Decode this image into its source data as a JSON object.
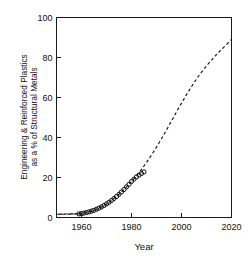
{
  "chart_data": {
    "type": "line",
    "title": "",
    "xlabel": "Year",
    "ylabel": "Engineering & Reinforced Plastics as a % of Structural Metals",
    "ylabel_line1": "Engineering & Reinforced Plastics",
    "ylabel_line2": "as a % of Structural Metals",
    "xlim": [
      1950,
      2020
    ],
    "ylim": [
      0,
      100
    ],
    "xticks": [
      1960,
      1980,
      2000,
      2020
    ],
    "xtick_labels": [
      "1960",
      "1980",
      "2000",
      "2020"
    ],
    "yticks": [
      0,
      20,
      40,
      60,
      80,
      100
    ],
    "ytick_labels": [
      "0",
      "20",
      "40",
      "60",
      "80",
      "100"
    ],
    "grid": false,
    "legend": "none",
    "series": [
      {
        "name": "Observed data",
        "marker": "open-circle",
        "x": [
          1959,
          1960,
          1961,
          1962,
          1963,
          1964,
          1965,
          1966,
          1967,
          1968,
          1969,
          1970,
          1971,
          1972,
          1973,
          1974,
          1975,
          1976,
          1977,
          1978,
          1979,
          1980,
          1981,
          1982,
          1983,
          1984,
          1985
        ],
        "values": [
          1.8,
          2.0,
          2.2,
          2.5,
          2.8,
          3.2,
          3.6,
          4.1,
          4.7,
          5.3,
          6.0,
          6.8,
          7.6,
          8.5,
          9.5,
          10.5,
          11.6,
          12.8,
          14.0,
          15.3,
          16.6,
          18.0,
          19.2,
          20.3,
          21.2,
          22.0,
          22.8
        ]
      },
      {
        "name": "Projected trend",
        "style": "dashed",
        "x": [
          1950,
          1955,
          1959,
          1962,
          1965,
          1968,
          1971,
          1974,
          1977,
          1980,
          1983,
          1986,
          1989,
          1992,
          1995,
          1998,
          2001,
          2004,
          2007,
          2010,
          2013,
          2016,
          2020
        ],
        "values": [
          1.6,
          1.7,
          1.9,
          2.5,
          3.6,
          5.3,
          7.6,
          10.5,
          14.0,
          18.0,
          22.4,
          27.5,
          33.2,
          39.4,
          46.0,
          52.8,
          59.3,
          65.4,
          71.0,
          75.8,
          80.1,
          84.0,
          89.0
        ]
      }
    ]
  },
  "axes": {
    "frame_color": "#1a1a1a",
    "tick_direction": "in",
    "background": "#ffffff"
  }
}
